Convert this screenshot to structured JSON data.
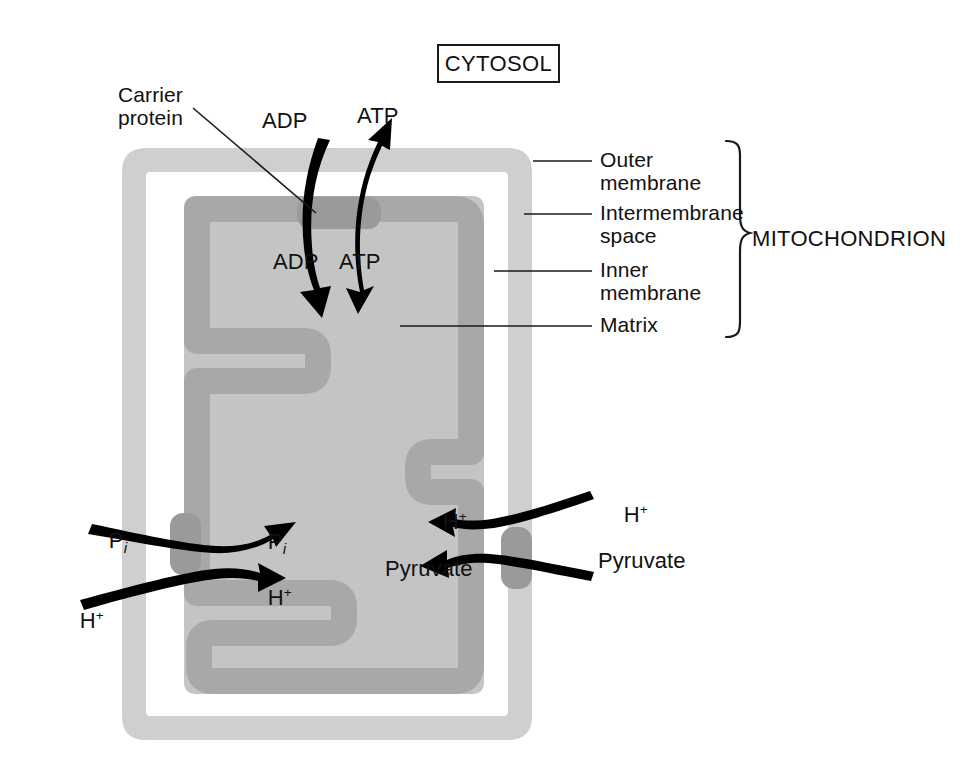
{
  "figure": {
    "cytosol_label": "CYTOSOL",
    "organelle_label": "MITOCHONDRION"
  },
  "colors": {
    "outer_membrane": "#cfcfcf",
    "intermembrane_space": "#ffffff",
    "inner_membrane": "#a8a8a8",
    "matrix": "#c4c4c4",
    "carrier_protein": "#9a9a9a",
    "arrow": "#000000",
    "text": "#111111",
    "leader_line": "#1a1a1a"
  },
  "structure_labels": [
    {
      "id": "outer-membrane",
      "line1": "Outer",
      "line2": "membrane"
    },
    {
      "id": "intermembrane-space",
      "line1": "Intermembrane",
      "line2": "space"
    },
    {
      "id": "inner-membrane",
      "line1": "Inner",
      "line2": "membrane"
    },
    {
      "id": "matrix",
      "line1": "Matrix",
      "line2": ""
    }
  ],
  "callout": {
    "carrier_protein_line1": "Carrier",
    "carrier_protein_line2": "protein"
  },
  "transport": {
    "adp_cytosol": "ADP",
    "adp_matrix": "ADP",
    "atp_matrix": "ATP",
    "atp_cytosol": "ATP",
    "pi_cytosol": "P",
    "pi_cytosol_sub": "i",
    "pi_matrix": "P",
    "pi_matrix_sub": "i",
    "h_cytosol_left": "H",
    "h_matrix_left": "H",
    "h_cytosol_right": "H",
    "h_matrix_right": "H",
    "h_charge": "+",
    "pyruvate_cytosol": "Pyruvate",
    "pyruvate_matrix": "Pyruvate"
  },
  "transport_events": [
    {
      "species": "ADP",
      "direction": "cytosol-to-matrix",
      "carrier": "adp-atp-translocase"
    },
    {
      "species": "ATP",
      "direction": "matrix-to-cytosol",
      "carrier": "adp-atp-translocase"
    },
    {
      "species": "Pi",
      "direction": "cytosol-to-matrix",
      "carrier": "phosphate-carrier"
    },
    {
      "species": "H+",
      "direction": "cytosol-to-matrix",
      "carrier": "phosphate-carrier"
    },
    {
      "species": "H+",
      "direction": "cytosol-to-matrix",
      "carrier": "pyruvate-carrier"
    },
    {
      "species": "Pyruvate",
      "direction": "cytosol-to-matrix",
      "carrier": "pyruvate-carrier"
    }
  ]
}
